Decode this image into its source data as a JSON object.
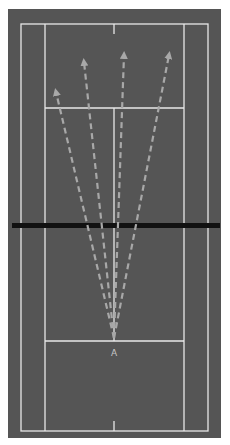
{
  "diagram": {
    "type": "badminton-court",
    "colors": {
      "court": "#555555",
      "lines": "#e8e8e8",
      "net": "#111111",
      "arrows": "#a8a8a8",
      "label": "#c8c8c8"
    },
    "origin_label": "A",
    "arrows": [
      {
        "name": "arrow-to-left-mid",
        "from": [
          114,
          338
        ],
        "to": [
          56,
          92
        ]
      },
      {
        "name": "arrow-to-left-deep",
        "from": [
          114,
          338
        ],
        "to": [
          84,
          62
        ]
      },
      {
        "name": "arrow-to-center-deep",
        "from": [
          114,
          338
        ],
        "to": [
          124,
          55
        ]
      },
      {
        "name": "arrow-to-right-deep",
        "from": [
          114,
          338
        ],
        "to": [
          169,
          55
        ]
      }
    ]
  }
}
